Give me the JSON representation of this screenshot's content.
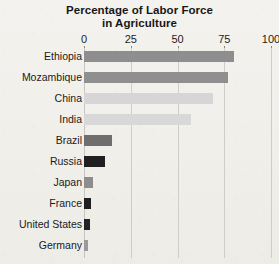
{
  "chart_data": {
    "type": "bar",
    "orientation": "horizontal",
    "title": "Percentage of Labor Force in Agriculture",
    "title_lines": [
      "Percentage of Labor Force",
      "in Agriculture"
    ],
    "xlabel": "",
    "ylabel": "",
    "xlim": [
      0,
      100
    ],
    "xticks": [
      0,
      25,
      50,
      75,
      100
    ],
    "xtick_labels": [
      "0",
      "25",
      "50",
      "75",
      "100"
    ],
    "grid": "vertical",
    "legend": "none",
    "categories": [
      "Ethiopia",
      "Mozambique",
      "China",
      "India",
      "Brazil",
      "Russia",
      "Japan",
      "France",
      "United States",
      "Germany"
    ],
    "values": [
      80,
      77,
      69,
      57,
      15,
      11,
      5,
      4,
      3,
      2
    ],
    "bar_colors": [
      "#8e8e8e",
      "#8f8f8f",
      "#d6d6d6",
      "#d8d8d8",
      "#6e6e6e",
      "#202020",
      "#8d8d8d",
      "#1f1f1f",
      "#232323",
      "#9a9a9a"
    ],
    "bars": [
      {
        "label": "Ethiopia",
        "value": 80,
        "color": "#8e8e8e"
      },
      {
        "label": "Mozambique",
        "value": 77,
        "color": "#8f8f8f"
      },
      {
        "label": "China",
        "value": 69,
        "color": "#d6d6d6"
      },
      {
        "label": "India",
        "value": 57,
        "color": "#d8d8d8"
      },
      {
        "label": "Brazil",
        "value": 15,
        "color": "#6e6e6e"
      },
      {
        "label": "Russia",
        "value": 11,
        "color": "#202020"
      },
      {
        "label": "Japan",
        "value": 5,
        "color": "#8d8d8d"
      },
      {
        "label": "France",
        "value": 4,
        "color": "#1f1f1f"
      },
      {
        "label": "United States",
        "value": 3,
        "color": "#232323"
      },
      {
        "label": "Germany",
        "value": 2,
        "color": "#9a9a9a"
      }
    ]
  },
  "colors": {
    "background": "#f3f1ed",
    "gridline": "#cfcdc8",
    "text": "#1b1b1b"
  }
}
